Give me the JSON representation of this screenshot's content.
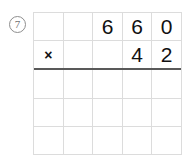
{
  "problem": {
    "number_label": "7",
    "label_style": "circled",
    "operation": "multiplication",
    "multiplicand": "660",
    "multiplier": "42",
    "operator_symbol": "×"
  },
  "colors": {
    "background": "#ffffff",
    "grid_line": "#dcdcdc",
    "answer_rule": "#595959",
    "digit": "#111111",
    "label": "#6f6f6f"
  },
  "grid": {
    "columns": 5,
    "rows": 5,
    "rows_data": [
      {
        "name": "multiplicand-row",
        "rule_below": false,
        "cells": [
          {
            "name": "cell-r1c1",
            "text": "",
            "empty": true,
            "operator": false
          },
          {
            "name": "cell-r1c2",
            "text": "",
            "empty": true,
            "operator": false
          },
          {
            "name": "cell-r1c3",
            "text": "6",
            "empty": false,
            "operator": false
          },
          {
            "name": "cell-r1c4",
            "text": "6",
            "empty": false,
            "operator": false
          },
          {
            "name": "cell-r1c5",
            "text": "0",
            "empty": false,
            "operator": false
          }
        ]
      },
      {
        "name": "multiplier-row",
        "rule_below": true,
        "cells": [
          {
            "name": "cell-r2c1",
            "text": "×",
            "empty": false,
            "operator": true
          },
          {
            "name": "cell-r2c2",
            "text": "",
            "empty": true,
            "operator": false
          },
          {
            "name": "cell-r2c3",
            "text": "",
            "empty": true,
            "operator": false
          },
          {
            "name": "cell-r2c4",
            "text": "4",
            "empty": false,
            "operator": false
          },
          {
            "name": "cell-r2c5",
            "text": "2",
            "empty": false,
            "operator": false
          }
        ]
      },
      {
        "name": "partial-product-row-1",
        "rule_below": false,
        "cells": [
          {
            "name": "cell-r3c1",
            "text": "",
            "empty": true,
            "operator": false
          },
          {
            "name": "cell-r3c2",
            "text": "",
            "empty": true,
            "operator": false
          },
          {
            "name": "cell-r3c3",
            "text": "",
            "empty": true,
            "operator": false
          },
          {
            "name": "cell-r3c4",
            "text": "",
            "empty": true,
            "operator": false
          },
          {
            "name": "cell-r3c5",
            "text": "",
            "empty": true,
            "operator": false
          }
        ]
      },
      {
        "name": "partial-product-row-2",
        "rule_below": false,
        "cells": [
          {
            "name": "cell-r4c1",
            "text": "",
            "empty": true,
            "operator": false
          },
          {
            "name": "cell-r4c2",
            "text": "",
            "empty": true,
            "operator": false
          },
          {
            "name": "cell-r4c3",
            "text": "",
            "empty": true,
            "operator": false
          },
          {
            "name": "cell-r4c4",
            "text": "",
            "empty": true,
            "operator": false
          },
          {
            "name": "cell-r4c5",
            "text": "",
            "empty": true,
            "operator": false
          }
        ]
      },
      {
        "name": "total-row",
        "rule_below": false,
        "cells": [
          {
            "name": "cell-r5c1",
            "text": "",
            "empty": true,
            "operator": false
          },
          {
            "name": "cell-r5c2",
            "text": "",
            "empty": true,
            "operator": false
          },
          {
            "name": "cell-r5c3",
            "text": "",
            "empty": true,
            "operator": false
          },
          {
            "name": "cell-r5c4",
            "text": "",
            "empty": true,
            "operator": false
          },
          {
            "name": "cell-r5c5",
            "text": "",
            "empty": true,
            "operator": false
          }
        ]
      }
    ]
  }
}
